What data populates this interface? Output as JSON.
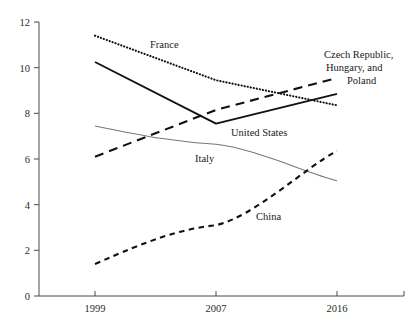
{
  "chart_data": {
    "type": "line",
    "title": "",
    "subtitle": "",
    "xlabel": "",
    "ylabel": "",
    "x": [
      "1999",
      "2007",
      "2016"
    ],
    "xtick_labels": [
      "1999",
      "2007",
      "2016"
    ],
    "ytick_labels": [
      "0",
      "2",
      "4",
      "6",
      "8",
      "10",
      "12"
    ],
    "ylim": [
      0,
      12
    ],
    "ytick_values": [
      0,
      2,
      4,
      6,
      8,
      10,
      12
    ],
    "grid": false,
    "legend": "inline-annotations",
    "series": [
      {
        "name": "France",
        "style": "dotted",
        "color": "#111111",
        "values": [
          11.4,
          9.45,
          8.35
        ]
      },
      {
        "name": "United States",
        "style": "solid",
        "color": "#111111",
        "values": [
          10.25,
          7.55,
          8.85
        ]
      },
      {
        "name": "Czech Republic, Hungary, and Poland",
        "style": "long-dashed",
        "color": "#111111",
        "values": [
          6.1,
          8.15,
          9.55
        ]
      },
      {
        "name": "Italy",
        "style": "thin-solid",
        "color": "#777777",
        "values": [
          7.45,
          6.65,
          5.05
        ]
      },
      {
        "name": "China",
        "style": "short-dashed",
        "color": "#111111",
        "values": [
          1.4,
          3.1,
          6.35
        ]
      }
    ],
    "annotations": [
      {
        "id": "france",
        "text": "France"
      },
      {
        "id": "united-states",
        "text": "United States"
      },
      {
        "id": "czech-hungary-poland-line1",
        "text": "Czech Republic,"
      },
      {
        "id": "czech-hungary-poland-line2",
        "text": "Hungary, and"
      },
      {
        "id": "czech-hungary-poland-line3",
        "text": "Poland"
      },
      {
        "id": "italy",
        "text": "Italy"
      },
      {
        "id": "china",
        "text": "China"
      }
    ]
  },
  "axis": {
    "y_labels": {
      "t0": "0",
      "t2": "2",
      "t4": "4",
      "t6": "6",
      "t8": "8",
      "t10": "10",
      "t12": "12"
    },
    "x_labels": {
      "x1": "1999",
      "x2": "2007",
      "x3": "2016"
    }
  },
  "labels": {
    "france": "France",
    "united_states": "United States",
    "czech_line1": "Czech Republic,",
    "czech_line2": "Hungary, and",
    "czech_line3": "Poland",
    "italy": "Italy",
    "china": "China"
  },
  "colors": {
    "ink": "#111111",
    "axis": "#4a4a4a",
    "italy_gray": "#777777",
    "background": "#ffffff"
  }
}
